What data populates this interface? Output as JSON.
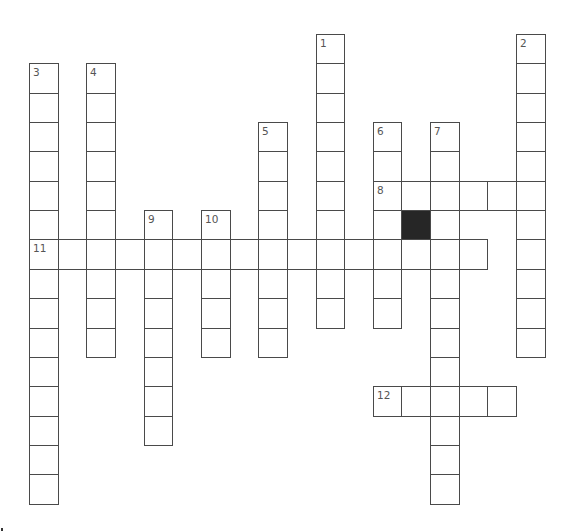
{
  "puzzle": {
    "type": "crossword",
    "grid": {
      "origin_x": 29,
      "origin_y": 34,
      "cell_w": 28.65,
      "cell_h": 29.35,
      "line_color": "#4a4a4a",
      "blocked_color": "#262626",
      "number_color": "#555555"
    },
    "entries": [
      {
        "number": "1",
        "direction": "down",
        "row": 0,
        "col": 10,
        "length": 10
      },
      {
        "number": "2",
        "direction": "down",
        "row": 0,
        "col": 17,
        "length": 11
      },
      {
        "number": "3",
        "direction": "down",
        "row": 1,
        "col": 0,
        "length": 15
      },
      {
        "number": "4",
        "direction": "down",
        "row": 1,
        "col": 2,
        "length": 10
      },
      {
        "number": "5",
        "direction": "down",
        "row": 3,
        "col": 8,
        "length": 8
      },
      {
        "number": "6",
        "direction": "down",
        "row": 3,
        "col": 12,
        "length": 7
      },
      {
        "number": "7",
        "direction": "down",
        "row": 3,
        "col": 14,
        "length": 13
      },
      {
        "number": "8",
        "direction": "across",
        "row": 5,
        "col": 12,
        "length": 6
      },
      {
        "number": "9",
        "direction": "down",
        "row": 6,
        "col": 4,
        "length": 8
      },
      {
        "number": "10",
        "direction": "down",
        "row": 6,
        "col": 6,
        "length": 5
      },
      {
        "number": "11",
        "direction": "across",
        "row": 7,
        "col": 0,
        "length": 16
      },
      {
        "number": "12",
        "direction": "across",
        "row": 12,
        "col": 12,
        "length": 5
      }
    ],
    "blocked_cells": [
      {
        "row": 6,
        "col": 13
      }
    ]
  }
}
